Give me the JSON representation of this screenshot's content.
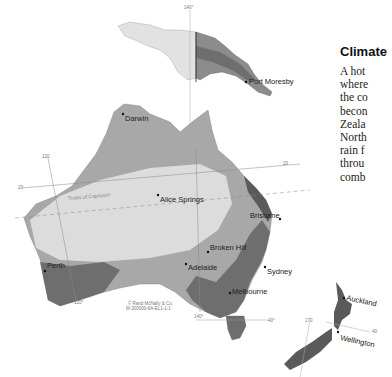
{
  "title": "Climate",
  "paragraph_lines": [
    "A hot",
    "where",
    "the co",
    "becon",
    "Zeala",
    "North",
    "rain f",
    "throu",
    "comb"
  ],
  "map": {
    "cities": [
      {
        "name": "Port Moresby"
      },
      {
        "name": "Darwin"
      },
      {
        "name": "Alice Springs"
      },
      {
        "name": "Brisbane"
      },
      {
        "name": "Broken Hill"
      },
      {
        "name": "Perth"
      },
      {
        "name": "Adelaide"
      },
      {
        "name": "Sydney"
      },
      {
        "name": "Melbourne"
      },
      {
        "name": "Auckland"
      },
      {
        "name": "Wellington"
      }
    ],
    "graticule_labels": {
      "lon_140_top": "140°",
      "lon_120_upper": "120",
      "lat_20_left": "20",
      "lat_20_right": "20",
      "lon_120_bottom": "120°",
      "lon_140_bottom": "140°",
      "lat_40": "40°",
      "lon_170": "170",
      "lat_40_nz": "40"
    },
    "tropic_label": "Tropic of Capricorn",
    "copyright": [
      "© Rand McNally & Co.",
      "M-300000-6A-EL1-1-1"
    ],
    "zone_colors": {
      "arid": "#dcdcdc",
      "semi_arid": "#b4b4b4",
      "tropical": "#a8a8a8",
      "temperate": "#6e6e6e",
      "humid": "#5a5a5a",
      "new_guinea_light": "#e2e2e2"
    }
  }
}
